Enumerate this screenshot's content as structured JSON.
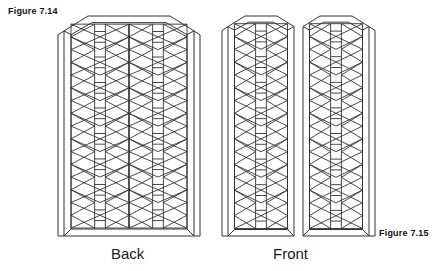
{
  "page": {
    "width": 441,
    "height": 271,
    "background": "#ffffff"
  },
  "figures": {
    "top_left_label": "Figure 7.14",
    "bottom_right_label": "Figure 7.15"
  },
  "captions": {
    "back": "Back",
    "front": "Front"
  },
  "drawing": {
    "subject": "lattice-panel-line-drawing",
    "stroke_color": "#333333",
    "fill_color": "#ffffff",
    "line_width_frame": 1.0,
    "line_width_lattice": 0.9,
    "back_panel": {
      "type": "single-wide-panel",
      "columns": 2,
      "lattice_rows": 8,
      "top_shape": "chamfered-arch"
    },
    "front_panel": {
      "type": "two-door-panel",
      "doors": 2,
      "columns_per_door": 1,
      "lattice_rows": 8,
      "top_shape": "chamfered-arch"
    }
  }
}
